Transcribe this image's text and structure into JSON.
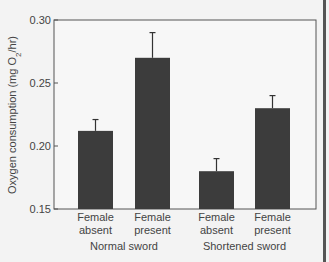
{
  "chart_data": {
    "type": "bar",
    "title": "",
    "xlabel": "",
    "ylabel": "Oxygen consumption (mg O2/hr)",
    "ylabel_parts": {
      "main": "Oxygen consumption (mg O",
      "sub": "2",
      "end": "/hr)"
    },
    "ylim": [
      0.15,
      0.3
    ],
    "yticks": [
      "0.15",
      "0.20",
      "0.25",
      "0.30"
    ],
    "grid": false,
    "legend": null,
    "groups": [
      {
        "label": "Normal sword",
        "categories": [
          "Female absent",
          "Female present"
        ]
      },
      {
        "label": "Shortened sword",
        "categories": [
          "Female absent",
          "Female present"
        ]
      }
    ],
    "categories": [
      {
        "line1": "Female",
        "line2": "absent",
        "group": "Normal sword"
      },
      {
        "line1": "Female",
        "line2": "present",
        "group": "Normal sword"
      },
      {
        "line1": "Female",
        "line2": "absent",
        "group": "Shortened sword"
      },
      {
        "line1": "Female",
        "line2": "present",
        "group": "Shortened sword"
      }
    ],
    "values": [
      0.212,
      0.27,
      0.18,
      0.23
    ],
    "error_upper": [
      0.221,
      0.29,
      0.19,
      0.24
    ],
    "bar_color": "#3c3c3c"
  }
}
